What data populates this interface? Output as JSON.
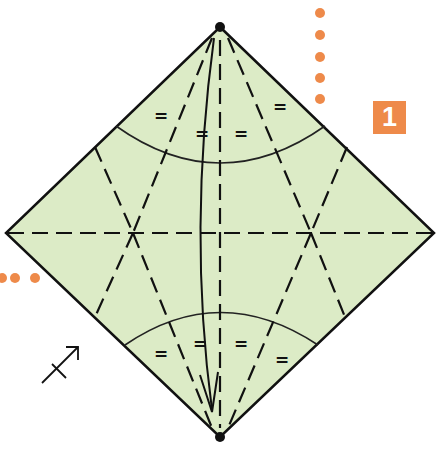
{
  "step": {
    "number": "1"
  },
  "colors": {
    "paper": "#dcebc6",
    "outline": "#111111",
    "guide_dots": "#ee8a4a",
    "badge": "#ee8a4a"
  },
  "markers": {
    "equal_sign": "=",
    "double_tick": "≠"
  },
  "symbols": {
    "turn_over": "repeat-fold-arrow-icon"
  },
  "diagram": {
    "shape": "square paper rotated 45° (diamond)",
    "corners": {
      "top": [
        220,
        27
      ],
      "right": [
        434,
        233
      ],
      "bottom": [
        220,
        437
      ],
      "left": [
        6,
        233
      ]
    },
    "folds": [
      "horizontal valley fold through center",
      "vertical valley fold through center",
      "diagonal dashed folds forming two kite shapes",
      "curved arcs near top and bottom corners"
    ],
    "equal_marks_top": [
      "=",
      "=",
      "=",
      "="
    ],
    "equal_marks_bottom": [
      "=",
      "=",
      "=",
      "="
    ],
    "arrow": "fold bottom corner up along center"
  }
}
